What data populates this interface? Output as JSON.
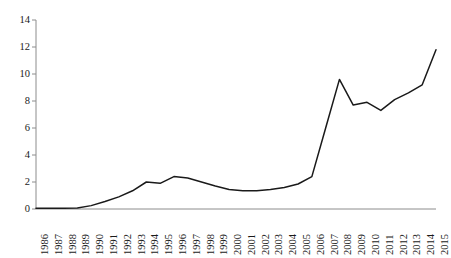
{
  "chart_data": {
    "type": "line",
    "title": "",
    "subtitle": "",
    "xlabel": "",
    "ylabel": "",
    "categories": [
      "1986",
      "1987",
      "1988",
      "1989",
      "1990",
      "1991",
      "1992",
      "1993",
      "1994",
      "1995",
      "1996",
      "1997",
      "1998",
      "1999",
      "2000",
      "2001",
      "2002",
      "2003",
      "2004",
      "2005",
      "2006",
      "2007",
      "2008",
      "2009",
      "2010",
      "2011",
      "2012",
      "2013",
      "2014",
      "2015"
    ],
    "values": [
      0.05,
      0.05,
      0.06,
      0.08,
      0.25,
      0.55,
      0.9,
      1.35,
      2.0,
      1.9,
      2.4,
      2.3,
      2.0,
      1.7,
      1.45,
      1.35,
      1.35,
      1.45,
      1.6,
      1.85,
      2.4,
      6.0,
      9.6,
      7.7,
      7.9,
      7.3,
      8.1,
      8.6,
      9.2,
      11.8
    ],
    "series": [
      {
        "name": "series-1",
        "values": [
          0.05,
          0.05,
          0.06,
          0.08,
          0.25,
          0.55,
          0.9,
          1.35,
          2.0,
          1.9,
          2.4,
          2.3,
          2.0,
          1.7,
          1.45,
          1.35,
          1.35,
          1.45,
          1.6,
          1.85,
          2.4,
          6.0,
          9.6,
          7.7,
          7.9,
          7.3,
          8.1,
          8.6,
          9.2,
          11.8
        ],
        "color": "#1a1a1a"
      }
    ],
    "y_ticks": [
      0,
      2,
      4,
      6,
      8,
      10,
      12,
      14
    ],
    "ylim": [
      0,
      14
    ],
    "xlim_categories": [
      "1986",
      "2015"
    ],
    "grid": false,
    "legend": null,
    "legend_position": "none",
    "annotations": [],
    "line_color": "#1a1a1a",
    "axis_color": "#8c8c8c",
    "background_color": "#ffffff",
    "markers": false
  }
}
